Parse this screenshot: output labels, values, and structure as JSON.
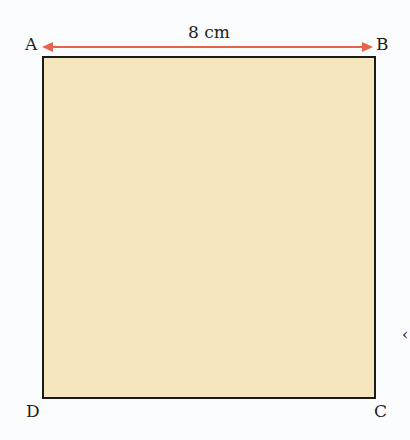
{
  "diagram": {
    "shape": "square",
    "vertices": {
      "top_left": "A",
      "top_right": "B",
      "bottom_right": "C",
      "bottom_left": "D"
    },
    "measurement": {
      "label": "8 cm",
      "side": "AB",
      "arrow_color": "#e8624e"
    },
    "fill_color": "#f5e6bd",
    "stroke_color": "#1a1a1a",
    "edge_glyph": "‹"
  }
}
